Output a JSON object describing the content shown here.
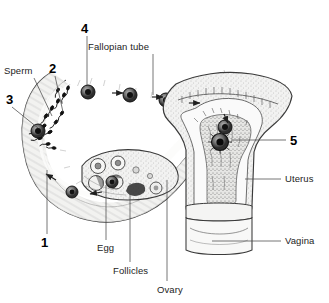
{
  "figure": {
    "kind": "anatomical-line-drawing",
    "background_color": "#ffffff",
    "ink_color": "#2b2b2b",
    "label_color": "#232323"
  },
  "numbered_labels": [
    {
      "id": "n1",
      "text": "1",
      "x": 41,
      "y": 236,
      "leader": {
        "x1": 47,
        "y1": 234,
        "x2": 47,
        "y2": 170
      },
      "meaning": "fallopian-tube-distal-segment"
    },
    {
      "id": "n2",
      "text": "2",
      "x": 49,
      "y": 62,
      "leader": {
        "x1": 55,
        "y1": 76,
        "x2": 63,
        "y2": 112
      },
      "meaning": "tube-lumen-with-sperm"
    },
    {
      "id": "n3",
      "text": "3",
      "x": 6,
      "y": 93,
      "leader": {
        "x1": 12,
        "y1": 107,
        "x2": 38,
        "y2": 128
      },
      "meaning": "fertilization-site"
    },
    {
      "id": "n4",
      "text": "4",
      "x": 81,
      "y": 22,
      "leader": {
        "x1": 87,
        "y1": 36,
        "x2": 87,
        "y2": 85
      },
      "meaning": "zygote-in-ampulla"
    },
    {
      "id": "n5",
      "text": "5",
      "x": 290,
      "y": 134,
      "leader": {
        "x1": 286,
        "y1": 140,
        "x2": 232,
        "y2": 140
      },
      "meaning": "implantation-in-endometrium"
    }
  ],
  "term_labels": [
    {
      "id": "sperm",
      "text": "Sperm",
      "x": 4,
      "y": 66,
      "leader": {
        "x1": 34,
        "y1": 78,
        "x2": 52,
        "y2": 116
      }
    },
    {
      "id": "fallopian_tube",
      "text": "Fallopian tube",
      "x": 88,
      "y": 42,
      "leader": {
        "x1": 153,
        "y1": 54,
        "x2": 153,
        "y2": 95
      }
    },
    {
      "id": "egg",
      "text": "Egg",
      "x": 97,
      "y": 243,
      "leader": {
        "x1": 106,
        "y1": 240,
        "x2": 106,
        "y2": 185
      }
    },
    {
      "id": "follicles",
      "text": "Follicles",
      "x": 113,
      "y": 266,
      "leader": {
        "x1": 130,
        "y1": 262,
        "x2": 130,
        "y2": 183
      }
    },
    {
      "id": "ovary",
      "text": "Ovary",
      "x": 157,
      "y": 285,
      "leader": {
        "x1": 167,
        "y1": 281,
        "x2": 167,
        "y2": 180
      }
    },
    {
      "id": "uterus",
      "text": "Uterus",
      "x": 285,
      "y": 174,
      "leader": {
        "x1": 281,
        "y1": 179,
        "x2": 245,
        "y2": 179
      }
    },
    {
      "id": "vagina",
      "text": "Vagina",
      "x": 285,
      "y": 236,
      "leader": {
        "x1": 281,
        "y1": 241,
        "x2": 212,
        "y2": 241
      }
    }
  ],
  "structures": {
    "fallopian_tube": "curved arching duct running from left loop up and across to the uterine fundus",
    "ovary": "oval body below the tube containing follicles at several maturation stages",
    "uterus": "pear-shaped organ, right of centre, with thick endometrial lining",
    "cervix": "narrow neck between uterine body and vagina",
    "vagina": "short canal at base of the uterus"
  },
  "flow_arrows": [
    {
      "x": 118,
      "y": 93,
      "dir": "right"
    },
    {
      "x": 160,
      "y": 98,
      "dir": "right"
    },
    {
      "x": 196,
      "y": 105,
      "dir": "right"
    },
    {
      "x": 196,
      "y": 117,
      "dir": "right-down"
    },
    {
      "x": 95,
      "y": 193,
      "dir": "left"
    },
    {
      "x": 44,
      "y": 176,
      "dir": "left-up"
    }
  ],
  "cells": [
    {
      "name": "zygote",
      "x": 88,
      "y": 92,
      "r": 7
    },
    {
      "name": "dividing-ovum",
      "x": 130,
      "y": 95,
      "r": 7
    },
    {
      "name": "dividing-ovum",
      "x": 166,
      "y": 100,
      "r": 7
    },
    {
      "name": "morula",
      "x": 212,
      "y": 106,
      "r": 7
    },
    {
      "name": "blastocyst",
      "x": 225,
      "y": 127,
      "r": 7
    },
    {
      "name": "implanting-blastocyst",
      "x": 220,
      "y": 142,
      "r": 8
    },
    {
      "name": "released-egg",
      "x": 112,
      "y": 182,
      "r": 6
    },
    {
      "name": "travelling-egg",
      "x": 72,
      "y": 192,
      "r": 6
    },
    {
      "name": "fertilized-egg",
      "x": 38,
      "y": 131,
      "r": 7
    }
  ]
}
